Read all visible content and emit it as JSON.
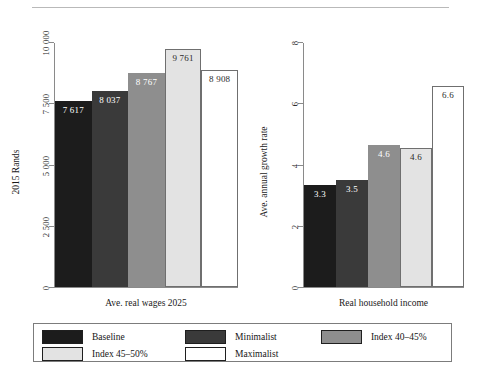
{
  "chart_data": [
    {
      "type": "bar",
      "panel": "left",
      "title": "",
      "xlabel": "Ave. real wages 2025",
      "ylabel": "2015 Rands",
      "ylim": [
        0,
        10000
      ],
      "yticks": [
        "0",
        "2 500",
        "5 000",
        "7 500",
        "10 000"
      ],
      "ytick_values": [
        0,
        2500,
        5000,
        7500,
        10000
      ],
      "grid": false,
      "categories": [
        "Baseline",
        "Minimalist",
        "Index 40–45%",
        "Index 45–50%",
        "Maximalist"
      ],
      "values": [
        7617,
        8037,
        8767,
        9761,
        8908
      ],
      "labels": [
        "7 617",
        "8 037",
        "8 767",
        "9 761",
        "8 908"
      ]
    },
    {
      "type": "bar",
      "panel": "right",
      "title": "",
      "xlabel": "Real household income",
      "ylabel": "Ave. annual growth rate",
      "ylim": [
        0,
        8
      ],
      "yticks": [
        "0",
        "2",
        "4",
        "6",
        "8"
      ],
      "ytick_values": [
        0,
        2,
        4,
        6,
        8
      ],
      "grid": false,
      "categories": [
        "Baseline",
        "Minimalist",
        "Index 40–45%",
        "Index 45–50%",
        "Maximalist"
      ],
      "values": [
        3.35,
        3.5,
        4.65,
        4.55,
        6.6
      ],
      "labels": [
        "3.3",
        "3.5",
        "4.6",
        "4.6",
        "6.6"
      ]
    }
  ],
  "legend": {
    "position": "bottom",
    "entries": [
      {
        "label": "Baseline",
        "color": "#1c1c1c"
      },
      {
        "label": "Minimalist",
        "color": "#3a3a3a"
      },
      {
        "label": "Index 40–45%",
        "color": "#8e8e8e"
      },
      {
        "label": "Index 45–50%",
        "color": "#e3e3e3"
      },
      {
        "label": "Maximalist",
        "color": "#ffffff"
      }
    ]
  },
  "series_colors": [
    "#1c1c1c",
    "#3a3a3a",
    "#8e8e8e",
    "#e3e3e3",
    "#ffffff"
  ],
  "label_colors": [
    "#ffffff",
    "#ffffff",
    "#ffffff",
    "#2b2b2b",
    "#2b2b2b"
  ]
}
